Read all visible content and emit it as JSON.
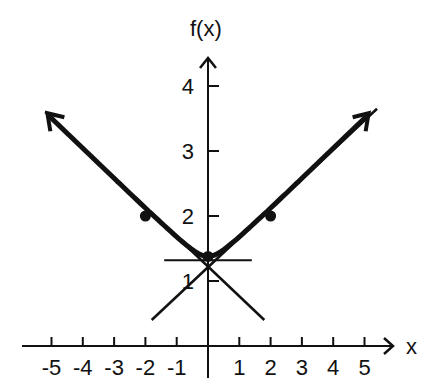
{
  "chart_data": {
    "type": "line",
    "title": "",
    "xlabel": "x",
    "ylabel": "f(x)",
    "xlim": [
      -5.5,
      6
    ],
    "ylim": [
      0,
      4.5
    ],
    "grid": false,
    "legend": null,
    "x_ticks": [
      -5,
      -4,
      -3,
      -2,
      -1,
      1,
      2,
      3,
      4,
      5
    ],
    "x_tick_labels": [
      "-5",
      "-4",
      "-3",
      "-2",
      "-1",
      "1",
      "2",
      "3",
      "4",
      "5"
    ],
    "y_ticks": [
      1,
      2,
      3,
      4
    ],
    "y_tick_labels": [
      "1",
      "2",
      "3",
      "4"
    ],
    "series": [
      {
        "name": "f(x)",
        "style": "thick curve with arrows at both ends",
        "x": [
          -5.2,
          -4,
          -3,
          -2,
          -1,
          0,
          1,
          2,
          3,
          4,
          5.2
        ],
        "values": [
          3.6,
          3.05,
          2.55,
          2.0,
          1.6,
          1.38,
          1.6,
          2.0,
          2.55,
          3.05,
          3.6
        ]
      }
    ],
    "marked_points": [
      {
        "x": -2,
        "y": 2
      },
      {
        "x": 0,
        "y": 1.38
      },
      {
        "x": 2,
        "y": 2
      }
    ],
    "asymptotes": [
      {
        "name": "left-asymptote",
        "from": [
          -5.2,
          3.6
        ],
        "to": [
          1.8,
          0.4
        ]
      },
      {
        "name": "right-asymptote",
        "from": [
          5.4,
          3.65
        ],
        "to": [
          -1.8,
          0.4
        ]
      }
    ],
    "horizontal_line": {
      "y": 1.32,
      "x_from": -1.4,
      "x_to": 1.4
    }
  }
}
